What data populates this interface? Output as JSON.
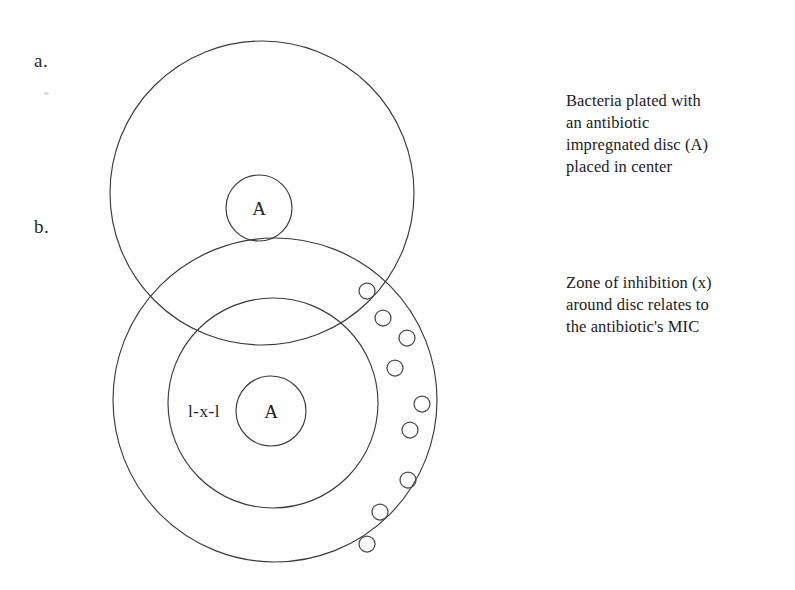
{
  "figure": {
    "panels": [
      {
        "key": "a",
        "label": "a."
      },
      {
        "key": "b",
        "label": "b."
      }
    ],
    "captions": {
      "top": "Bacteria plated with\nan antibiotic\nimpregnated disc (A)\nplaced in center",
      "bottom": "Zone of inhibition (x)\naround disc relates to\nthe antibiotic's MIC"
    },
    "disc_label_a": "A",
    "disc_label_b": "A",
    "zone_measure_label": "l-x-l",
    "colors": {
      "stroke": "#3a3a3a",
      "colony_stroke": "#4a4a4a",
      "text": "#1c1c1c",
      "background": "#ffffff"
    }
  },
  "geometry": {
    "plate_a": {
      "cx": 262,
      "cy": 193,
      "r": 152
    },
    "disc_a": {
      "cx": 259,
      "cy": 208,
      "r": 33
    },
    "plate_b_outer": {
      "cx": 275,
      "cy": 400,
      "r": 162
    },
    "plate_b_zone": {
      "cx": 273,
      "cy": 403,
      "r": 105
    },
    "disc_b": {
      "cx": 271,
      "cy": 411,
      "r": 35
    },
    "colony_radius": 8,
    "colonies": [
      {
        "cx": 367,
        "cy": 291
      },
      {
        "cx": 383,
        "cy": 318
      },
      {
        "cx": 407,
        "cy": 338
      },
      {
        "cx": 395,
        "cy": 368
      },
      {
        "cx": 422,
        "cy": 404
      },
      {
        "cx": 410,
        "cy": 430
      },
      {
        "cx": 408,
        "cy": 480
      },
      {
        "cx": 380,
        "cy": 512
      },
      {
        "cx": 367,
        "cy": 544
      }
    ]
  }
}
